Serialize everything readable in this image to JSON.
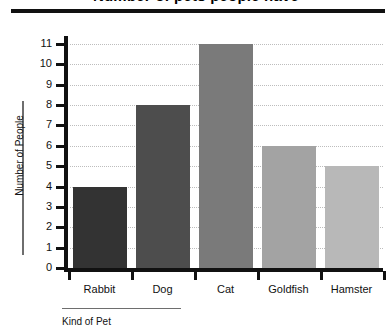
{
  "chart_data": {
    "type": "bar",
    "title": "Number of pets people have",
    "categories": [
      "Rabbit",
      "Dog",
      "Cat",
      "Goldfish",
      "Hamster"
    ],
    "values": [
      4,
      8,
      11,
      6,
      5
    ],
    "xlabel": "Kind of Pet",
    "ylabel": "Number of People",
    "ylim": [
      0,
      11
    ],
    "ytick_labels": [
      "11",
      "10",
      "9",
      "8",
      "7",
      "6",
      "5",
      "4",
      "3",
      "2",
      "1",
      "0"
    ],
    "ytick_values": [
      11,
      10,
      9,
      8,
      7,
      6,
      5,
      4,
      3,
      2,
      1,
      0
    ],
    "grid": true,
    "grid_style": "dotted",
    "legend": "none",
    "bar_colors": [
      "#333333",
      "#4d4d4d",
      "#7a7a7a",
      "#a3a3a3",
      "#b8b8b8"
    ],
    "colors": {
      "axis": "#111111",
      "grid": "#bdbdbd",
      "text": "#111111",
      "background": "#ffffff"
    }
  }
}
